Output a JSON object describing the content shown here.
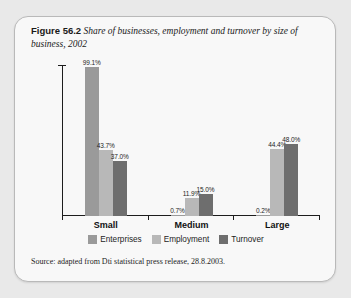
{
  "figure": {
    "label": "Figure 56.2",
    "title": "Share of businesses, employment and turnover by size of business, 2002",
    "source": "Source: adapted from Dti statistical press release, 28.8.2003."
  },
  "colors": {
    "enterprises": "#9a9a9a",
    "employment": "#b8b8b8",
    "turnover": "#6e6e6e",
    "axis": "#1d1d1d",
    "card_bg": "#f8f8f8",
    "card_border": "#b9b9b9",
    "page_bg": "#e9e9e9"
  },
  "chart_data": {
    "type": "bar",
    "title": "Share of businesses, employment and turnover by size of business, 2002",
    "xlabel": "",
    "ylabel": "",
    "ylim": [
      0,
      100
    ],
    "grid": false,
    "legend_position": "bottom",
    "categories": [
      "Small",
      "Medium",
      "Large"
    ],
    "series": [
      {
        "name": "Enterprises",
        "color": "#9a9a9a",
        "values": [
          99.1,
          0.7,
          0.2
        ]
      },
      {
        "name": "Employment",
        "color": "#b8b8b8",
        "values": [
          43.7,
          11.9,
          44.4
        ]
      },
      {
        "name": "Turnover",
        "color": "#6e6e6e",
        "values": [
          37.0,
          15.0,
          48.0
        ]
      }
    ],
    "value_labels": [
      [
        "99.1%",
        "43.7%",
        "37.0%"
      ],
      [
        "0.7%",
        "11.9%",
        "15.0%"
      ],
      [
        "0.2%",
        "44.4%",
        "48.0%"
      ]
    ]
  }
}
